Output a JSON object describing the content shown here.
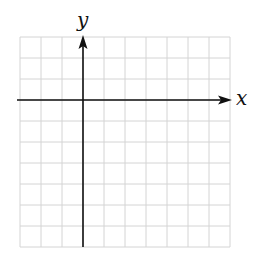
{
  "diagram": {
    "type": "coordinate-plane",
    "grid": {
      "columns": 10,
      "rows": 10,
      "left": 20,
      "top": 37,
      "cell_size": 21,
      "line_color": "#d4d4d4"
    },
    "axes": {
      "color": "#111111",
      "x_axis": {
        "label": "x",
        "row_index_from_top": 3,
        "arrow": "right"
      },
      "y_axis": {
        "label": "y",
        "column_index_from_left": 3,
        "arrow": "up"
      }
    }
  }
}
